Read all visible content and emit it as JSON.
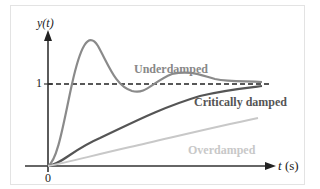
{
  "diagram": {
    "y_axis_label": "y(t)",
    "x_axis_label_var": "t",
    "x_axis_label_unit": " (s)",
    "y_tick_one": "1",
    "origin_label": "0",
    "curves": [
      {
        "name": "Underdamped",
        "color": "#888888"
      },
      {
        "name": "Critically damped",
        "color": "#555555"
      },
      {
        "name": "Overdamped",
        "color": "#c8c8c8"
      }
    ],
    "reference_line": {
      "value": 1,
      "style": "dashed",
      "color": "#222222"
    }
  }
}
